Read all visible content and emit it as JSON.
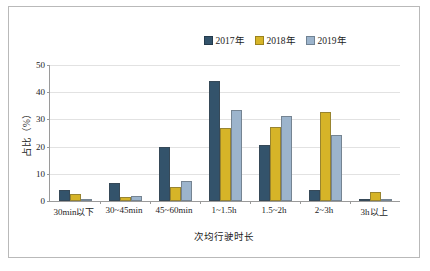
{
  "chart_data": {
    "type": "bar",
    "title": "",
    "xlabel": "次均行驶时长",
    "ylabel": "占比（%）",
    "ylim": [
      0,
      50
    ],
    "yticks": [
      0,
      10,
      20,
      30,
      40,
      50
    ],
    "ytick_labels": [
      "0",
      "10",
      "20",
      "30",
      "40",
      "50"
    ],
    "grid": true,
    "legend_position": "top-right",
    "categories": [
      "30min以下",
      "30~45min",
      "45~60min",
      "1~1.5h",
      "1.5~2h",
      "2~3h",
      "3h以上"
    ],
    "series": [
      {
        "name": "2017年",
        "color": "#33536B",
        "values": [
          4.2,
          6.6,
          19.9,
          44.1,
          20.6,
          4.2,
          0.3
        ]
      },
      {
        "name": "2018年",
        "color": "#D6B428",
        "values": [
          2.6,
          1.5,
          5.2,
          26.7,
          27.3,
          32.7,
          3.3
        ]
      },
      {
        "name": "2019年",
        "color": "#9CB4CC",
        "values": [
          0.3,
          1.9,
          7.5,
          33.4,
          31.1,
          24.1,
          0.8
        ]
      }
    ]
  },
  "colors": {
    "series_2017": "#33536B",
    "series_2018": "#D6B428",
    "series_2019": "#9CB4CC",
    "gridline": "#e2e2e2",
    "axis": "#9a9a9a",
    "frame_border": "#b9b9b9",
    "text": "#1c1c1c"
  }
}
